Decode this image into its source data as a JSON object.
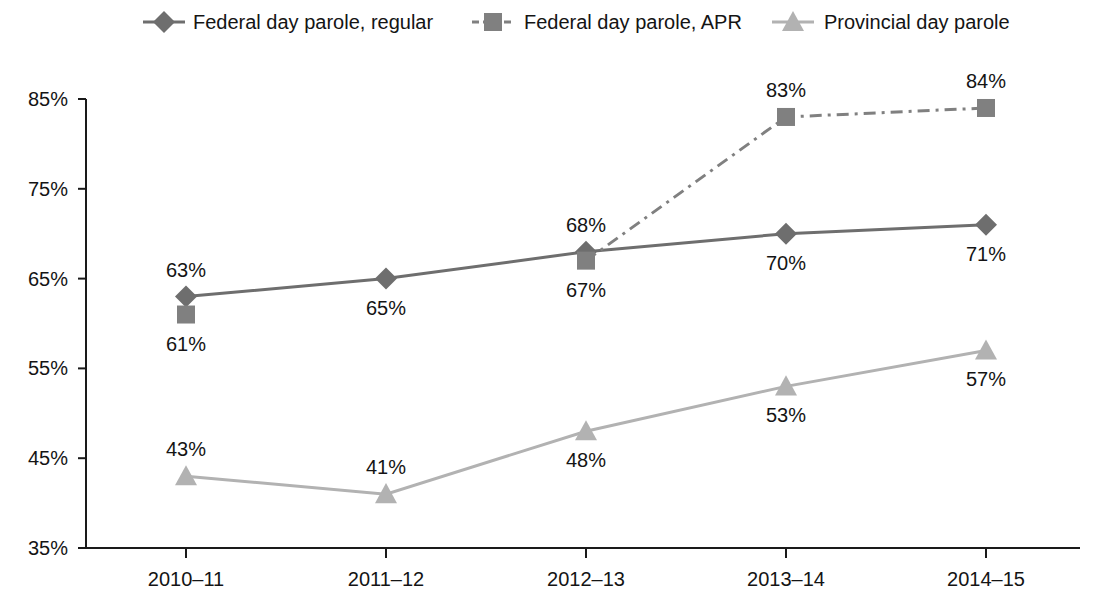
{
  "chart_data": {
    "type": "line",
    "title": "",
    "xlabel": "",
    "ylabel": "",
    "categories": [
      "2010–11",
      "2011–12",
      "2012–13",
      "2013–14",
      "2014–15"
    ],
    "ylim": [
      35,
      85
    ],
    "yticks": [
      35,
      45,
      55,
      65,
      75,
      85
    ],
    "ytick_labels": [
      "35%",
      "45%",
      "55%",
      "65%",
      "75%",
      "85%"
    ],
    "grid": false,
    "legend_position": "top",
    "series": [
      {
        "name": "Federal day parole, regular",
        "marker": "diamond",
        "line_style": "solid",
        "color": "#6e6e6e",
        "values": [
          63,
          65,
          68,
          70,
          71
        ],
        "value_labels": [
          "63%",
          "65%",
          "68%",
          "70%",
          "71%"
        ],
        "label_positions": [
          "above",
          "below",
          "above",
          "below",
          "below"
        ]
      },
      {
        "name": "Federal day parole, APR",
        "marker": "square",
        "line_style": "dash-dot",
        "color": "#808080",
        "values": [
          61,
          null,
          67,
          83,
          84
        ],
        "value_labels": [
          "61%",
          "",
          "67%",
          "83%",
          "84%"
        ],
        "label_positions": [
          "below",
          "none",
          "below",
          "above",
          "above"
        ]
      },
      {
        "name": "Provincial day parole",
        "marker": "triangle",
        "line_style": "solid",
        "color": "#b2b2b2",
        "values": [
          43,
          41,
          48,
          53,
          57
        ],
        "value_labels": [
          "43%",
          "41%",
          "48%",
          "53%",
          "57%"
        ],
        "label_positions": [
          "above",
          "above",
          "below",
          "below",
          "below"
        ]
      }
    ]
  },
  "legend": {
    "items": [
      {
        "label": "Federal day parole, regular"
      },
      {
        "label": "Federal day parole, APR"
      },
      {
        "label": "Provincial day parole"
      }
    ]
  },
  "colors": {
    "series_regular": "#6e6e6e",
    "series_apr": "#808080",
    "series_provincial": "#b2b2b2",
    "axis": "#1a1a1a",
    "text": "#141414",
    "background": "#ffffff"
  }
}
